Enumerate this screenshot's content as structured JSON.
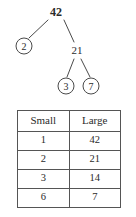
{
  "diagram": {
    "type": "factor-tree",
    "nodes": [
      {
        "id": "root",
        "label": "42",
        "circled": false,
        "bold": true,
        "x": 56,
        "y": 12
      },
      {
        "id": "left",
        "label": "2",
        "circled": true,
        "bold": false,
        "x": 24,
        "y": 46
      },
      {
        "id": "right",
        "label": "21",
        "circled": false,
        "bold": false,
        "x": 77,
        "y": 50
      },
      {
        "id": "rl",
        "label": "3",
        "circled": true,
        "bold": false,
        "x": 66,
        "y": 86
      },
      {
        "id": "rr",
        "label": "7",
        "circled": true,
        "bold": false,
        "x": 91,
        "y": 86
      }
    ],
    "edges": [
      {
        "from": "root",
        "to": "left",
        "x1": 48,
        "y1": 20,
        "x2": 29,
        "y2": 38
      },
      {
        "from": "root",
        "to": "right",
        "x1": 64,
        "y1": 20,
        "x2": 74,
        "y2": 42
      },
      {
        "from": "right",
        "to": "rl",
        "x1": 74,
        "y1": 59,
        "x2": 67,
        "y2": 77
      },
      {
        "from": "right",
        "to": "rr",
        "x1": 81,
        "y1": 59,
        "x2": 90,
        "y2": 77
      }
    ],
    "stroke_color": "#4a4a4a"
  },
  "table": {
    "headers": [
      "Small",
      "Large"
    ],
    "rows": [
      [
        "1",
        "42"
      ],
      [
        "2",
        "21"
      ],
      [
        "3",
        "14"
      ],
      [
        "6",
        "7"
      ]
    ]
  }
}
